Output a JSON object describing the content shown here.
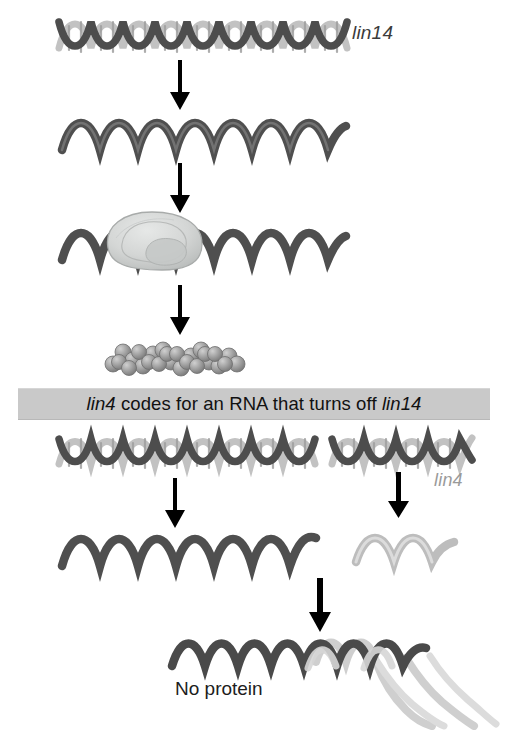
{
  "figure": {
    "domain": "diagram",
    "canvas": {
      "width": 507,
      "height": 730,
      "background": "#ffffff"
    }
  },
  "labels": {
    "lin14_gene": "lin14",
    "lin4_gene": "lin4",
    "no_protein": "No protein"
  },
  "banner": {
    "text_full": "lin4 codes for an RNA that turns off lin14",
    "part_italic_1": "lin4",
    "part_plain": " codes for an RNA that turns off ",
    "part_italic_2": "lin14",
    "background_color": "#c9c9c9"
  },
  "colors": {
    "dna_strand_dark": "#4a4a4a",
    "dna_strand_light": "#bdbdbd",
    "rna_dark": "#4f4f4f",
    "rna_light": "#b9b9b9",
    "ribosome_fill": "#d2d4d3",
    "ribosome_stroke": "#a8abaa",
    "protein_bead": "#9d9d9d",
    "arrow": "#000000",
    "text_dark": "#1d1d1d",
    "text_gray": "#9a9a9a"
  },
  "panels": {
    "top_pathway": {
      "name": "lin14 expressed (no lin4)",
      "steps": [
        {
          "id": "lin14-dna",
          "type": "dna-double-helix",
          "label": "lin14",
          "turns": 9
        },
        {
          "id": "arrow-transcription",
          "type": "arrow-down"
        },
        {
          "id": "lin14-mrna",
          "type": "rna-single-strand",
          "turns": 7
        },
        {
          "id": "arrow-translation",
          "type": "arrow-down"
        },
        {
          "id": "ribosome-on-mrna",
          "type": "rna-with-ribosome",
          "turns": 7
        },
        {
          "id": "arrow-protein",
          "type": "arrow-down"
        },
        {
          "id": "lin14-protein",
          "type": "protein-bead-chain",
          "beads": 26
        }
      ]
    },
    "bottom_pathway": {
      "name": "lin4 present, lin14 silenced",
      "steps": [
        {
          "id": "lin14-dna-2",
          "type": "dna-double-helix",
          "turns": 9
        },
        {
          "id": "lin4-dna",
          "type": "dna-double-helix",
          "label": "lin4",
          "turns": 4
        },
        {
          "id": "arrow-transcription-lin14",
          "type": "arrow-down"
        },
        {
          "id": "arrow-transcription-lin4",
          "type": "arrow-down"
        },
        {
          "id": "lin14-mrna-2",
          "type": "rna-single-strand",
          "turns": 7
        },
        {
          "id": "lin4-rna",
          "type": "rna-single-strand-light",
          "turns": 2
        },
        {
          "id": "arrow-binding",
          "type": "arrow-down"
        },
        {
          "id": "lin4-lin14-duplex",
          "type": "rna-rna-duplex"
        },
        {
          "id": "no-protein-text",
          "type": "text",
          "label": "No protein"
        }
      ]
    }
  }
}
